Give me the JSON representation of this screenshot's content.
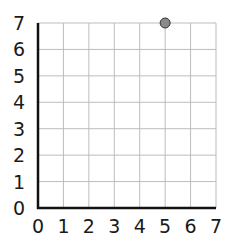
{
  "chart_data": {
    "type": "scatter",
    "title": "",
    "xlabel": "",
    "ylabel": "",
    "xlim": [
      0,
      7
    ],
    "ylim": [
      0,
      7
    ],
    "grid": true,
    "x_ticks": [
      "0",
      "1",
      "2",
      "3",
      "4",
      "5",
      "6",
      "7"
    ],
    "y_ticks": [
      "0",
      "1",
      "2",
      "3",
      "4",
      "5",
      "6",
      "7"
    ],
    "points": [
      {
        "x": 5,
        "y": 7
      }
    ],
    "point_color": "#8a8a8a"
  }
}
